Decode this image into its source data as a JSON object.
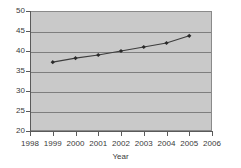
{
  "chart_data": {
    "type": "line",
    "title": "",
    "xlabel": "Year",
    "ylabel": "",
    "x": [
      1999,
      2000,
      2001,
      2002,
      2003,
      2004,
      2005
    ],
    "values": [
      37.2,
      38.2,
      39.0,
      40.0,
      41.0,
      42.0,
      43.8
    ],
    "series": [
      {
        "name": "",
        "x": [
          1999,
          2000,
          2001,
          2002,
          2003,
          2004,
          2005
        ],
        "values": [
          37.2,
          38.2,
          39.0,
          40.0,
          41.0,
          42.0,
          43.8
        ]
      }
    ],
    "xlim": [
      1998,
      2006
    ],
    "ylim": [
      20,
      50
    ],
    "x_ticks": [
      1998,
      1999,
      2000,
      2001,
      2002,
      2003,
      2004,
      2005,
      2006
    ],
    "y_ticks": [
      20,
      25,
      30,
      35,
      40,
      45,
      50
    ],
    "x_tick_labels": [
      "1998",
      "1999",
      "2000",
      "2001",
      "2002",
      "2003",
      "2004",
      "2005",
      "2006"
    ],
    "y_tick_labels": [
      "20",
      "25",
      "30",
      "35",
      "40",
      "45",
      "50"
    ],
    "grid": "horizontal",
    "legend": "none",
    "marker": "diamond",
    "colors": {
      "plot_background": "#c9c9c9",
      "figure_background": "#ffffff",
      "gridline": "#7e7e7e",
      "axis": "#5a5a5a",
      "series_line": "#3d3d3d",
      "series_marker": "#2a2a2a",
      "tick_text": "#3a3a3a"
    }
  }
}
